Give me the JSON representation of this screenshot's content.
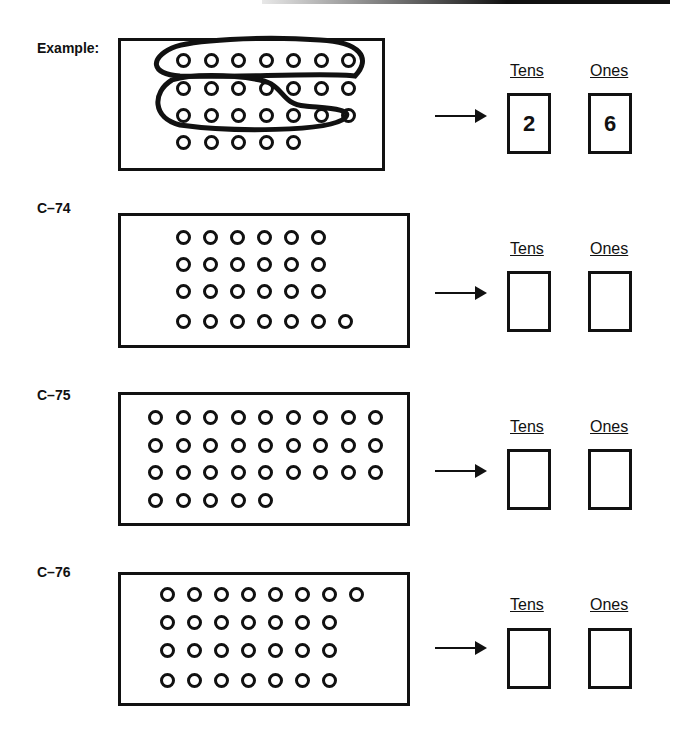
{
  "worksheet": {
    "problems": [
      {
        "id": "example",
        "label": "Example:",
        "rows": [
          7,
          7,
          7,
          5
        ],
        "total": 26,
        "tens_header": "Tens",
        "ones_header": "Ones",
        "tens_answer": "2",
        "ones_answer": "6",
        "groups_circled": 2
      },
      {
        "id": "c74",
        "label": "C–74",
        "rows": [
          6,
          6,
          6,
          7
        ],
        "tens_header": "Tens",
        "ones_header": "Ones",
        "tens_answer": "",
        "ones_answer": ""
      },
      {
        "id": "c75",
        "label": "C–75",
        "rows": [
          9,
          9,
          9,
          5
        ],
        "tens_header": "Tens",
        "ones_header": "Ones",
        "tens_answer": "",
        "ones_answer": ""
      },
      {
        "id": "c76",
        "label": "C–76",
        "rows": [
          8,
          7,
          7,
          7
        ],
        "tens_header": "Tens",
        "ones_header": "Ones",
        "tens_answer": "",
        "ones_answer": ""
      }
    ]
  }
}
